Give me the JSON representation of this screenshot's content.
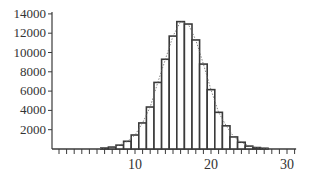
{
  "chart_data": {
    "type": "bar",
    "title": "",
    "xlabel": "",
    "ylabel": "",
    "categories": [
      6,
      7,
      8,
      9,
      10,
      11,
      12,
      13,
      14,
      15,
      16,
      17,
      18,
      19,
      20,
      21,
      22,
      23,
      24,
      25,
      26,
      27
    ],
    "values": [
      100,
      200,
      400,
      800,
      1450,
      2700,
      4350,
      6900,
      9300,
      11700,
      13200,
      12950,
      11300,
      8800,
      6150,
      3800,
      2400,
      1250,
      700,
      300,
      150,
      80
    ],
    "overlay_line": {
      "style": "dotted",
      "description": "fitted curve through bar tops"
    },
    "xlim": [
      0,
      32
    ],
    "ylim": [
      0,
      14000
    ],
    "x_ticks": [
      10,
      20,
      30
    ],
    "x_minor_tick_step": 1,
    "y_ticks": [
      2000,
      4000,
      6000,
      8000,
      10000,
      12000,
      14000
    ],
    "grid": false,
    "legend": null
  },
  "axis": {
    "y_tick_labels": [
      "2000",
      "4000",
      "6000",
      "8000",
      "10000",
      "12000",
      "14000"
    ],
    "x_tick_labels": [
      "10",
      "20",
      "30"
    ]
  }
}
